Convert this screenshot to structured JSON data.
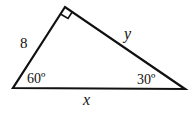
{
  "diagram": {
    "type": "right-triangle",
    "sides": {
      "left": "8",
      "hypotenuse_right": "y",
      "base": "x"
    },
    "angles": {
      "bottom_left": "60º",
      "bottom_right": "30º",
      "top": "right-angle"
    },
    "colors": {
      "stroke": "#111111",
      "background": "#ffffff"
    }
  }
}
